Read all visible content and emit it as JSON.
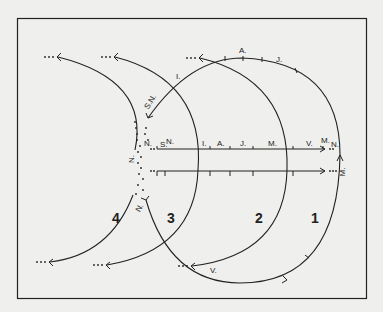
{
  "figure": {
    "type": "orbit-diagram",
    "colors": {
      "background": "#efefed",
      "ink": "#222222"
    },
    "arc_labels": [
      "1",
      "2",
      "3",
      "4"
    ],
    "month_labels_upper_line": [
      "N.",
      "S.",
      "N.",
      "I.",
      "A.",
      "J.",
      "M.",
      "V.",
      "M.",
      "N."
    ],
    "labels": {
      "arc1_top_A": "A.",
      "arc1_top_J": "J.",
      "arc1_left_I": "I.",
      "arc1_left_SN": "S.N.",
      "node_N_left": "N.",
      "node_N_vertical": "N.",
      "upper_S": "S.",
      "upper_N": "N.",
      "upper_I": "I.",
      "upper_A": "A.",
      "upper_J": "J.",
      "upper_M": "M.",
      "upper_V": "V.",
      "upper_M2": "M.",
      "upper_N2": "N.",
      "right_M": "M.",
      "lower_N": "N.",
      "bottom_V": "V.",
      "num1": "1",
      "num2": "2",
      "num3": "3",
      "num4": "4",
      "continuation": "···"
    }
  }
}
